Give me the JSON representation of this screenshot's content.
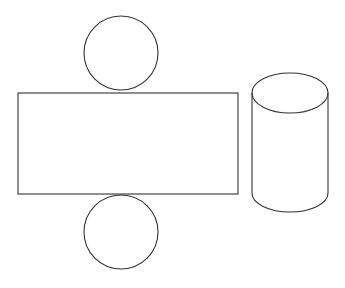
{
  "diagram": {
    "title": "",
    "type": "cylinder-net",
    "stroke_color": "#333333",
    "background": "#ffffff",
    "shapes": {
      "top_circle": {
        "cx": 121,
        "cy": 53,
        "r": 37
      },
      "rectangle": {
        "x": 18,
        "y": 93,
        "width": 220,
        "height": 101
      },
      "bottom_circle": {
        "cx": 121,
        "cy": 232,
        "r": 37
      },
      "cylinder": {
        "cx": 290,
        "top_cy": 93,
        "bottom_cy": 193,
        "rx": 38,
        "ry": 20
      }
    }
  }
}
